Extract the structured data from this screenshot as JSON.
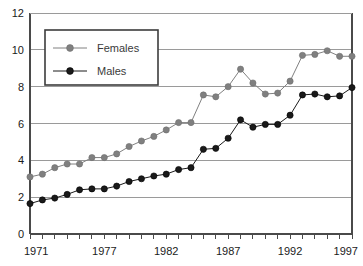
{
  "chart_data": {
    "type": "line",
    "title": "",
    "subtitle": "",
    "xlabel": "",
    "ylabel": "",
    "xlim": [
      1971,
      1997
    ],
    "ylim": [
      0,
      12
    ],
    "grid": true,
    "grid_axis": "y",
    "legend_position": "upper-left-inset",
    "x": [
      1971,
      1972,
      1973,
      1974,
      1975,
      1976,
      1977,
      1978,
      1979,
      1980,
      1981,
      1982,
      1983,
      1984,
      1985,
      1986,
      1987,
      1988,
      1989,
      1990,
      1991,
      1992,
      1993,
      1994,
      1995,
      1996,
      1997
    ],
    "xtick_values": [
      1971,
      1977,
      1982,
      1987,
      1992,
      1997
    ],
    "xtick_labels": [
      "1971",
      "1977",
      "1982",
      "1987",
      "1992",
      "1997"
    ],
    "ytick_values": [
      0,
      2,
      4,
      6,
      8,
      10,
      12
    ],
    "ytick_labels": [
      "0",
      "2",
      "4",
      "6",
      "8",
      "10",
      "12"
    ],
    "series": [
      {
        "name": "Females",
        "color": "#808080",
        "marker": "circle",
        "values": [
          3.1,
          3.25,
          3.6,
          3.8,
          3.8,
          4.15,
          4.15,
          4.35,
          4.75,
          5.05,
          5.3,
          5.65,
          6.05,
          6.05,
          7.55,
          7.45,
          8.0,
          8.95,
          8.2,
          7.6,
          7.65,
          8.3,
          9.7,
          9.75,
          9.95,
          9.65,
          9.65
        ]
      },
      {
        "name": "Males",
        "color": "#1a1a1a",
        "marker": "circle",
        "values": [
          1.65,
          1.85,
          1.95,
          2.15,
          2.4,
          2.45,
          2.45,
          2.6,
          2.85,
          3.0,
          3.15,
          3.25,
          3.5,
          3.6,
          4.6,
          4.65,
          5.2,
          6.2,
          5.8,
          5.95,
          5.95,
          6.45,
          7.55,
          7.6,
          7.45,
          7.5,
          7.95
        ]
      }
    ]
  },
  "legend": {
    "entries": [
      {
        "label": "Females",
        "color": "#808080"
      },
      {
        "label": "Males",
        "color": "#1a1a1a"
      }
    ]
  },
  "colors": {
    "females": "#808080",
    "males": "#1a1a1a",
    "gridline": "#9a9a9a",
    "axis": "#4a4a4a",
    "background": "#ffffff"
  }
}
